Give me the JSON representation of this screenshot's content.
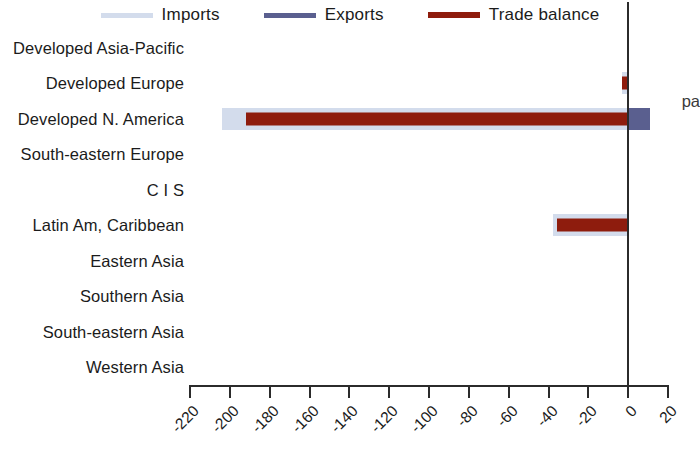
{
  "legend": {
    "position": "top-center",
    "items": [
      {
        "label": "Imports",
        "color": "#d3dcec",
        "name": "imports"
      },
      {
        "label": "Exports",
        "color": "#5a5f8f",
        "name": "exports"
      },
      {
        "label": "Trade balance",
        "color": "#8e1c0d",
        "name": "trade-balance"
      }
    ]
  },
  "annotation": {
    "cut_off_text": "pa"
  },
  "axis": {
    "tick_labels": [
      "-220",
      "-200",
      "-180",
      "-160",
      "-140",
      "-120",
      "-100",
      "-80",
      "-60",
      "-40",
      "-20",
      "0",
      "20"
    ],
    "tick_values": [
      -220,
      -200,
      -180,
      -160,
      -140,
      -120,
      -100,
      -80,
      -60,
      -40,
      -20,
      0,
      20
    ]
  },
  "chart_data": {
    "type": "bar",
    "orientation": "horizontal",
    "title": "",
    "xlabel": "",
    "ylabel": "",
    "xlim": [
      -220,
      20
    ],
    "grid": false,
    "legend_position": "top-center",
    "categories": [
      "Developed Asia-Pacific",
      "Developed Europe",
      "Developed N. America",
      "South-eastern Europe",
      "C I S",
      "Latin Am, Caribbean",
      "Eastern Asia",
      "Southern Asia",
      "South-eastern Asia",
      "Western Asia"
    ],
    "series": [
      {
        "name": "Imports",
        "color": "#d3dcec",
        "values": [
          0,
          -3,
          -204,
          0,
          0,
          -37.5,
          0,
          0,
          0,
          0
        ]
      },
      {
        "name": "Exports",
        "color": "#5a5f8f",
        "values": [
          0,
          0,
          11,
          0,
          0,
          0,
          0,
          0,
          0,
          0
        ]
      },
      {
        "name": "Trade balance",
        "color": "#8e1c0d",
        "values": [
          0,
          -3,
          -192,
          0,
          0,
          -35.5,
          0,
          0,
          0,
          0
        ]
      }
    ]
  }
}
